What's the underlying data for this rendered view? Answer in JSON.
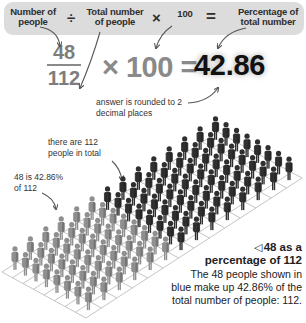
{
  "formula": {
    "term1": "Number of\npeople",
    "op_divide": "÷",
    "term2": "Total number\nof people",
    "op_times": "×",
    "term3": "100",
    "op_equals": "=",
    "term4": "Percentage of\ntotal number"
  },
  "worked": {
    "numerator": "48",
    "denominator": "112",
    "times_label": "× 100 =",
    "result": "42.86",
    "rounding_note_line1": "answer is rounded to 2",
    "rounding_note_line2": "decimal places"
  },
  "annotations": {
    "total_line1": "there are 112",
    "total_line2": "people in total",
    "part_line1": "48 is 42.86%",
    "part_line2": "of 112"
  },
  "caption": {
    "marker": "◁",
    "title_line1": "48 as a",
    "title_line2": "percentage of 112",
    "body_line1": "The 48 people shown in",
    "body_line2": "blue make up 42.86% of the",
    "body_line3": "total number of people: 112."
  },
  "people_grid": {
    "total": 112,
    "highlighted": 48,
    "columns": 8,
    "rows": 14,
    "highlight_color": "#8f8f8f",
    "other_color": "#2f2f2f",
    "grid_line_color": "#b5b5b5"
  },
  "colors": {
    "formula_bar_bg": "#dcdcdc",
    "fraction_text": "#7d7d7d",
    "result_text": "#111111",
    "arrow": "#555555"
  }
}
